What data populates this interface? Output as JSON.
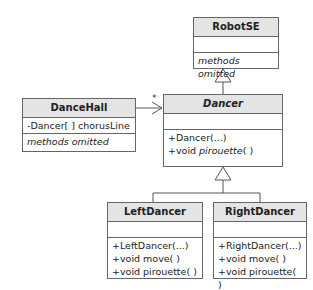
{
  "classes": {
    "robotse": {
      "name": "RobotSE",
      "attributes": [],
      "methods_note": "methods omitted"
    },
    "dancehall": {
      "name": "DanceHall",
      "attribute": "-Dancer[ ] chorusLine",
      "methods_note": "methods omitted"
    },
    "dancer": {
      "name": "Dancer",
      "abstract": true,
      "attributes": [],
      "method_1": "+Dancer(...)",
      "method_2_prefix": "+void ",
      "method_2_name": "pirouette",
      "method_2_suffix": "( )"
    },
    "leftdancer": {
      "name": "LeftDancer",
      "methods": [
        "+LeftDancer(...)",
        "+void move( )",
        "+void pirouette( )"
      ]
    },
    "rightdancer": {
      "name": "RightDancer",
      "methods": [
        "+RightDancer(...)",
        "+void move( )",
        "+void pirouette( )"
      ]
    }
  },
  "relations": {
    "association_multiplicity": "*",
    "association": "DanceHall -> Dancer",
    "generalizations": [
      "Dancer -> RobotSE",
      "LeftDancer -> Dancer",
      "RightDancer -> Dancer"
    ]
  }
}
